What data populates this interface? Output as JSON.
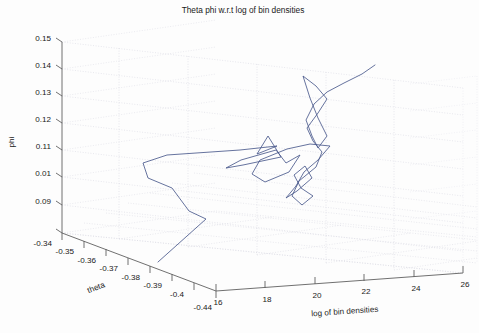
{
  "figure": {
    "title": "Theta phi w.r.t log of bin densities",
    "background_color": "#fdfdfd",
    "line_color": "#4a5a8c",
    "axis_color": "#555555",
    "grid_color": "#d8d8e0"
  },
  "chart_data": {
    "type": "line",
    "projection": "3d",
    "title": "Theta phi w.r.t log of bin densities",
    "xlabel": "theta",
    "ylabel": "log of bin densities",
    "zlabel": "phi",
    "grid": true,
    "legend": null,
    "xlim": [
      -0.44,
      -0.335
    ],
    "ylim": [
      15.0,
      26.4
    ],
    "zlim": [
      0.088,
      0.152
    ],
    "xticks": [
      "-0.34",
      "-0.35",
      "-0.36",
      "-0.37",
      "-0.38",
      "-0.39",
      "-0.4",
      "-0.44"
    ],
    "xtick_values": [
      -0.34,
      -0.35,
      -0.36,
      -0.37,
      -0.38,
      -0.39,
      -0.4,
      -0.44
    ],
    "yticks": [
      "16",
      "18",
      "20",
      "22",
      "24",
      "26"
    ],
    "ytick_values": [
      16,
      18,
      20,
      22,
      24,
      26
    ],
    "zticks": [
      "0.15",
      "0.14",
      "0.13",
      "0.12",
      "0.11",
      "0.01",
      "0.09"
    ],
    "ztick_values": [
      0.15,
      0.14,
      0.13,
      0.12,
      0.11,
      0.1,
      0.09
    ],
    "series": [
      {
        "name": "theta-phi trajectory",
        "color": "#4a5a8c",
        "style": "solid",
        "markers": "none",
        "points_px": [
          [
            158,
            262
          ],
          [
            206,
            219
          ],
          [
            189,
            211
          ],
          [
            172,
            188
          ],
          [
            148,
            178
          ],
          [
            143,
            163
          ],
          [
            167,
            155
          ],
          [
            240,
            150
          ],
          [
            277,
            146
          ],
          [
            257,
            154
          ],
          [
            268,
            136
          ],
          [
            281,
            157
          ],
          [
            243,
            165
          ],
          [
            226,
            168
          ],
          [
            241,
            160
          ],
          [
            276,
            150
          ],
          [
            286,
            163
          ],
          [
            300,
            155
          ],
          [
            289,
            172
          ],
          [
            265,
            182
          ],
          [
            252,
            174
          ],
          [
            260,
            160
          ],
          [
            287,
            149
          ],
          [
            310,
            144
          ],
          [
            330,
            146
          ],
          [
            318,
            160
          ],
          [
            304,
            172
          ],
          [
            296,
            186
          ],
          [
            286,
            198
          ],
          [
            297,
            191
          ],
          [
            312,
            178
          ],
          [
            305,
            166
          ],
          [
            294,
            175
          ],
          [
            301,
            188
          ],
          [
            313,
            196
          ],
          [
            302,
            205
          ],
          [
            292,
            196
          ],
          [
            299,
            181
          ],
          [
            316,
            167
          ],
          [
            322,
            152
          ],
          [
            313,
            141
          ],
          [
            307,
            128
          ],
          [
            318,
            113
          ],
          [
            327,
            99
          ],
          [
            316,
            86
          ],
          [
            303,
            76
          ],
          [
            310,
            98
          ],
          [
            318,
            118
          ],
          [
            327,
            136
          ],
          [
            318,
            148
          ],
          [
            312,
            136
          ],
          [
            306,
            120
          ],
          [
            314,
            104
          ],
          [
            327,
            92
          ],
          [
            344,
            83
          ],
          [
            362,
            74
          ],
          [
            375,
            65
          ]
        ]
      }
    ]
  },
  "axes": {
    "x_axis_name": "theta",
    "y_axis_name": "log of bin densities",
    "z_axis_name": "phi"
  }
}
